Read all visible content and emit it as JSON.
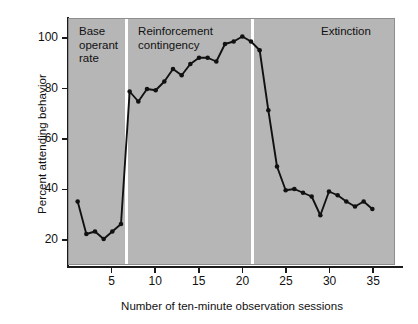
{
  "chart_data": {
    "type": "line",
    "title": "",
    "xlabel": "Number of ten-minute observation sessions",
    "ylabel": "Percent attending behavior",
    "xlim": [
      0,
      37.5
    ],
    "ylim": [
      10,
      108
    ],
    "xticks": [
      5,
      10,
      15,
      20,
      25,
      30,
      35
    ],
    "yticks": [
      20,
      40,
      60,
      80,
      100
    ],
    "grid": false,
    "legend": "none",
    "background_color": "#b6b6b6",
    "line_color": "#111111",
    "marker": "filled-circle",
    "series": [
      {
        "name": "Percent attending behavior",
        "x": [
          1,
          2,
          3,
          4,
          5,
          6,
          7,
          8,
          9,
          10,
          11,
          12,
          13,
          14,
          15,
          16,
          17,
          18,
          19,
          20,
          21,
          22,
          23,
          24,
          25,
          26,
          27,
          28,
          29,
          30,
          31,
          32,
          33,
          34,
          35
        ],
        "values": [
          35,
          22,
          23,
          20,
          23,
          26,
          79,
          75,
          80,
          79.5,
          83,
          88,
          85.5,
          90,
          92.5,
          92.5,
          91,
          98,
          99,
          101,
          99,
          95.5,
          71.5,
          49,
          39.5,
          40,
          38.5,
          37,
          29.5,
          39,
          37.5,
          35,
          33,
          35,
          32
        ]
      }
    ],
    "phases": [
      {
        "name": "base-operant-rate",
        "label": "Base\noperant\nrate",
        "x_start": 0,
        "x_end": 6.55
      },
      {
        "name": "reinforcement-contingency",
        "label": "Reinforcement\ncontingency",
        "x_start": 6.55,
        "x_end": 21.1
      },
      {
        "name": "extinction",
        "label": "Extinction",
        "x_start": 21.1,
        "x_end": 37.5
      }
    ],
    "dividers": [
      6.55,
      21.1
    ]
  }
}
